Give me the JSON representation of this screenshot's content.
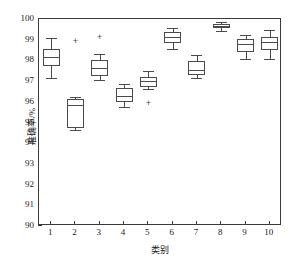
{
  "chart_data": {
    "type": "box",
    "title": "",
    "xlabel": "类别",
    "ylabel": "准确率/%",
    "ylim": [
      90,
      100
    ],
    "yticks": [
      90,
      91,
      92,
      93,
      94,
      95,
      96,
      97,
      98,
      99,
      100
    ],
    "xticks": [
      "1",
      "2",
      "3",
      "4",
      "5",
      "6",
      "7",
      "8",
      "9",
      "10"
    ],
    "grid": false,
    "legend": "none",
    "outlier_marker": "+",
    "box_color": "#4a4a4a",
    "axis_color": "#3a3a3a",
    "boxes": [
      {
        "category": "1",
        "whisker_low": 97.1,
        "q1": 97.7,
        "median": 98.1,
        "q3": 98.5,
        "whisker_high": 99.05,
        "outliers": []
      },
      {
        "category": "2",
        "whisker_low": 94.6,
        "q1": 94.7,
        "median": 95.8,
        "q3": 96.1,
        "whisker_high": 96.2,
        "outliers": [
          98.9
        ]
      },
      {
        "category": "3",
        "whisker_low": 97.0,
        "q1": 97.2,
        "median": 97.6,
        "q3": 97.95,
        "whisker_high": 98.25,
        "outliers": [
          99.1
        ]
      },
      {
        "category": "4",
        "whisker_low": 95.7,
        "q1": 95.95,
        "median": 96.25,
        "q3": 96.6,
        "whisker_high": 96.8,
        "outliers": []
      },
      {
        "category": "5",
        "whisker_low": 96.55,
        "q1": 96.65,
        "median": 96.95,
        "q3": 97.15,
        "whisker_high": 97.45,
        "outliers": [
          95.88
        ]
      },
      {
        "category": "6",
        "whisker_low": 98.5,
        "q1": 98.8,
        "median": 99.1,
        "q3": 99.3,
        "whisker_high": 99.5,
        "outliers": []
      },
      {
        "category": "7",
        "whisker_low": 97.1,
        "q1": 97.25,
        "median": 97.5,
        "q3": 97.9,
        "whisker_high": 98.2,
        "outliers": []
      },
      {
        "category": "8",
        "whisker_low": 99.35,
        "q1": 99.5,
        "median": 99.62,
        "q3": 99.72,
        "whisker_high": 99.8,
        "outliers": []
      },
      {
        "category": "9",
        "whisker_low": 98.0,
        "q1": 98.35,
        "median": 98.72,
        "q3": 99.0,
        "whisker_high": 99.2,
        "outliers": []
      },
      {
        "category": "10",
        "whisker_low": 98.0,
        "q1": 98.45,
        "median": 98.85,
        "q3": 99.1,
        "whisker_high": 99.4,
        "outliers": []
      }
    ]
  }
}
